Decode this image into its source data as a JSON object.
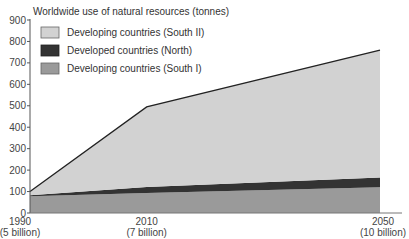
{
  "chart_data": {
    "type": "area",
    "stacked": true,
    "title": "Worldwide use of natural resources (tonnes)",
    "xlabel": "",
    "ylabel": "Worldwide use of natural resources (tonnes)",
    "x": [
      1990,
      2010,
      2050
    ],
    "categories": [
      "1990\n(5 billion)",
      "2010\n(7 billion)",
      "2050\n(10 billion)"
    ],
    "x_tick_labels": [
      {
        "year": "1990",
        "population": "(5 billion)"
      },
      {
        "year": "2010",
        "population": "(7 billion)"
      },
      {
        "year": "2050",
        "population": "(10 billion)"
      }
    ],
    "ylim": [
      0,
      900
    ],
    "y_ticks": [
      0,
      100,
      200,
      300,
      400,
      500,
      600,
      700,
      800,
      900
    ],
    "series": [
      {
        "name": "Developing countries (South I)",
        "values": [
          78,
          93,
          120
        ],
        "color": "#9a9a9a"
      },
      {
        "name": "Developed countries (North)",
        "values": [
          5,
          28,
          45
        ],
        "color": "#333333"
      },
      {
        "name": "Developing countries (South II)",
        "values": [
          17,
          374,
          595
        ],
        "color": "#d2d2d2"
      }
    ],
    "stacked_totals": {
      "south_i_top": [
        78,
        93,
        120
      ],
      "north_top": [
        83,
        121,
        165
      ],
      "south_ii_top": [
        100,
        495,
        760
      ]
    },
    "legend": {
      "position": "upper-left",
      "entries": [
        "Developing countries (South II)",
        "Developed countries (North)",
        "Developing countries (South I)"
      ]
    },
    "grid": false
  },
  "chart": {
    "title": "Worldwide use of natural resources (tonnes)",
    "legend": [
      {
        "label": "Developing countries (South II)",
        "color": "#d2d2d2"
      },
      {
        "label": "Developed countries (North)",
        "color": "#333333"
      },
      {
        "label": "Developing countries (South I)",
        "color": "#9a9a9a"
      }
    ],
    "y_ticks": [
      "0",
      "100",
      "200",
      "300",
      "400",
      "500",
      "600",
      "700",
      "800",
      "900"
    ],
    "x_ticks": [
      {
        "year": "1990",
        "population": "(5 billion)"
      },
      {
        "year": "2010",
        "population": "(7 billion)"
      },
      {
        "year": "2050",
        "population": "(10 billion)"
      }
    ]
  }
}
